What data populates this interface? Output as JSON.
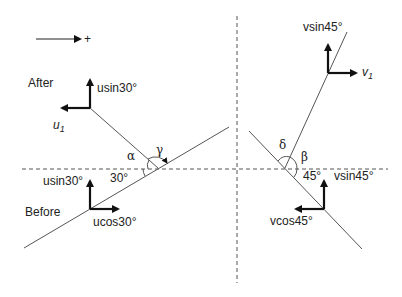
{
  "diagram": {
    "direction_indicator": {
      "label": "+",
      "icon": "positive-direction-arrow"
    },
    "left_panel": {
      "after_label": "After",
      "before_label": "Before",
      "after_vectors": {
        "up": "usin30°",
        "left_u": "u",
        "left_sub": "1"
      },
      "before_vectors": {
        "up": "usin30°",
        "right": "ucos30°"
      },
      "angles": {
        "alpha": "α",
        "gamma": "γ",
        "incline": "30°"
      }
    },
    "right_panel": {
      "after_vectors": {
        "up": "vsin45°",
        "right_v": "v",
        "right_sub": "1"
      },
      "before_vectors": {
        "up": "vsin45°",
        "left": "vcos45°"
      },
      "angles": {
        "delta": "δ",
        "beta": "β",
        "incline": "45°"
      }
    }
  }
}
